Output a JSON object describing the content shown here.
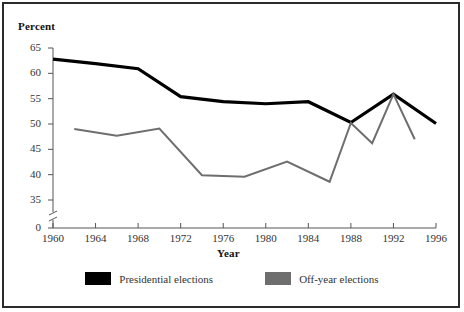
{
  "chart_data": {
    "type": "line",
    "title": "",
    "xlabel": "Year",
    "ylabel": "Percent",
    "xlim": [
      1960,
      1996
    ],
    "ylim": [
      35,
      65
    ],
    "y_axis_break": true,
    "y_axis_break_between": [
      0,
      35
    ],
    "yticks": [
      0,
      35,
      40,
      45,
      50,
      55,
      60,
      65
    ],
    "ytick_labels": [
      "0",
      "35",
      "40",
      "45",
      "50",
      "55",
      "60",
      "65"
    ],
    "xticks": [
      1960,
      1964,
      1968,
      1972,
      1976,
      1980,
      1984,
      1988,
      1992,
      1996
    ],
    "xtick_labels": [
      "1960",
      "1964",
      "1968",
      "1972",
      "1976",
      "1980",
      "1984",
      "1988",
      "1992",
      "1996"
    ],
    "grid": false,
    "legend_position": "bottom",
    "series": [
      {
        "name": "Presidential elections",
        "color": "#000000",
        "x": [
          1960,
          1964,
          1968,
          1972,
          1976,
          1980,
          1984,
          1988,
          1992,
          1996
        ],
        "values": [
          62.8,
          61.9,
          60.9,
          55.4,
          54.4,
          54.0,
          54.4,
          50.3,
          55.9,
          50.1
        ]
      },
      {
        "name": "Off-year elections",
        "color": "#6e6e6e",
        "x": [
          1962,
          1966,
          1970,
          1974,
          1978,
          1982,
          1986,
          1988,
          1990,
          1992,
          1994
        ],
        "values": [
          49.0,
          47.7,
          49.1,
          39.9,
          39.6,
          42.6,
          38.6,
          50.2,
          46.2,
          55.9,
          47.0
        ]
      }
    ]
  },
  "labels": {
    "y_axis_title": "Percent",
    "x_axis_title": "Year"
  },
  "legend": {
    "items": [
      {
        "label": "Presidential elections",
        "color": "#000000",
        "icon": "black-square-swatch"
      },
      {
        "label": "Off-year elections",
        "color": "#6e6e6e",
        "icon": "gray-square-swatch"
      }
    ]
  }
}
